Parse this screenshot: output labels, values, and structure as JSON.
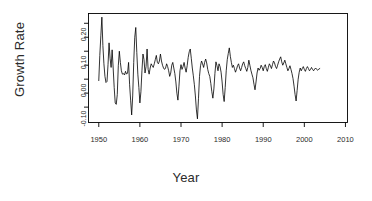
{
  "chart_data": {
    "type": "line",
    "title": "",
    "xlabel": "Year",
    "ylabel": "Growth Rate",
    "grid": false,
    "legend": null,
    "xlim": [
      1947.5,
      2010.5
    ],
    "ylim": [
      -0.155,
      0.235
    ],
    "xticks": [
      1950,
      1960,
      1970,
      1980,
      1990,
      2000,
      2010
    ],
    "xtick_labels": [
      "1950",
      "1960",
      "1970",
      "1980",
      "1990",
      "2000",
      "2010"
    ],
    "yticks": [
      -0.1,
      -0.05,
      0.0,
      0.05,
      0.1,
      0.15,
      0.2
    ],
    "ytick_labels": [
      "-0.10",
      "",
      "0.00",
      "",
      "0.10",
      "",
      "0.20"
    ],
    "line_color": "#000000",
    "line_width": 0.8,
    "frame": true,
    "x_start": 1950.0,
    "x_step": 0.25,
    "values": [
      -0.005,
      0.085,
      0.155,
      0.222,
      0.12,
      0.055,
      0.01,
      -0.012,
      -0.008,
      0.052,
      0.13,
      0.075,
      0.042,
      0.105,
      0.04,
      -0.03,
      -0.085,
      -0.09,
      -0.055,
      0.048,
      0.1,
      0.06,
      0.03,
      0.018,
      0.02,
      0.015,
      0.028,
      0.018,
      0.022,
      0.06,
      -0.02,
      -0.075,
      -0.128,
      -0.06,
      0.06,
      0.15,
      0.185,
      0.095,
      0.018,
      -0.03,
      -0.085,
      -0.045,
      0.03,
      0.09,
      0.07,
      0.022,
      0.045,
      0.108,
      0.035,
      0.018,
      0.04,
      0.055,
      0.048,
      0.042,
      0.055,
      0.07,
      0.085,
      0.06,
      0.055,
      0.065,
      0.09,
      0.065,
      0.05,
      0.04,
      0.035,
      0.04,
      0.055,
      0.045,
      0.03,
      0.01,
      0.022,
      0.05,
      0.06,
      0.04,
      0.02,
      -0.01,
      -0.05,
      -0.075,
      -0.025,
      0.03,
      0.052,
      0.035,
      0.045,
      0.06,
      0.04,
      0.025,
      0.048,
      0.078,
      0.098,
      0.108,
      0.075,
      0.04,
      0.012,
      -0.02,
      -0.06,
      -0.11,
      -0.142,
      -0.07,
      0.01,
      0.048,
      0.065,
      0.055,
      0.042,
      0.06,
      0.072,
      0.058,
      0.035,
      0.02,
      0.01,
      -0.015,
      -0.045,
      -0.068,
      -0.035,
      0.02,
      0.062,
      0.048,
      0.03,
      0.055,
      0.045,
      0.025,
      -0.01,
      -0.055,
      -0.08,
      -0.03,
      0.03,
      0.07,
      0.092,
      0.112,
      0.082,
      0.06,
      0.042,
      0.05,
      0.038,
      0.025,
      0.035,
      0.048,
      0.055,
      0.04,
      0.03,
      0.042,
      0.055,
      0.062,
      0.048,
      0.038,
      0.028,
      0.042,
      0.068,
      0.05,
      0.032,
      0.018,
      0.005,
      -0.018,
      -0.038,
      -0.01,
      0.022,
      0.04,
      0.032,
      0.038,
      0.05,
      0.042,
      0.03,
      0.045,
      0.052,
      0.038,
      0.028,
      0.042,
      0.055,
      0.048,
      0.038,
      0.052,
      0.065,
      0.058,
      0.045,
      0.038,
      0.05,
      0.062,
      0.072,
      0.08,
      0.062,
      0.05,
      0.058,
      0.068,
      0.055,
      0.042,
      0.03,
      0.038,
      0.048,
      0.035,
      0.02,
      0.002,
      -0.025,
      -0.055,
      -0.078,
      -0.04,
      0.0,
      0.025,
      0.04,
      0.03,
      0.038,
      0.045,
      0.035,
      0.028,
      0.038,
      0.045,
      0.038,
      0.03,
      0.035,
      0.042,
      0.035,
      0.03,
      0.036,
      0.04,
      0.035,
      0.032,
      0.036,
      0.038
    ]
  },
  "axes": {
    "y_title": "Growth Rate",
    "x_title": "Year"
  }
}
